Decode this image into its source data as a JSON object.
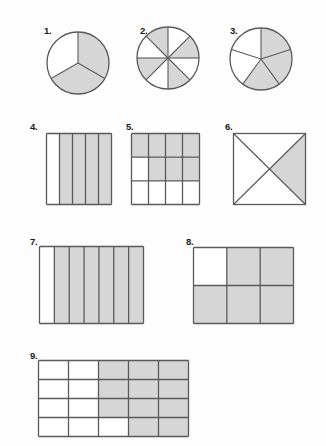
{
  "worksheet": {
    "title": "Fraction Shading Worksheet",
    "background_color": "#fdfdfd",
    "shade_color": "#d6d6d6",
    "stroke_color": "#5a5a5a",
    "unshaded_color": "#ffffff",
    "label_color": "#1a1a1a"
  },
  "figures": [
    {
      "number": "1.",
      "shape": "circle",
      "parts_total": 3,
      "parts_shaded": 2,
      "fraction": "2/3",
      "start_angle_deg": -90,
      "shaded_indices": [
        0,
        1
      ],
      "label_x": 44,
      "label_y": 26,
      "cx": 78,
      "cy": 63,
      "r": 31
    },
    {
      "number": "2.",
      "shape": "circle",
      "parts_total": 8,
      "parts_shaded": 4,
      "fraction": "4/8",
      "start_angle_deg": -90,
      "shaded_indices": [
        1,
        3,
        5,
        7
      ],
      "label_x": 140,
      "label_y": 26,
      "cx": 168,
      "cy": 58,
      "r": 31
    },
    {
      "number": "3.",
      "shape": "circle",
      "parts_total": 5,
      "parts_shaded": 3,
      "fraction": "3/5",
      "start_angle_deg": -90,
      "shaded_indices": [
        0,
        1,
        2
      ],
      "label_x": 230,
      "label_y": 26,
      "cx": 261,
      "cy": 59,
      "r": 31
    },
    {
      "number": "4.",
      "shape": "grid",
      "columns": 5,
      "rows": 1,
      "parts_total": 5,
      "parts_shaded": 4,
      "fraction": "4/5",
      "shaded_cells": [
        [
          0,
          1
        ],
        [
          0,
          2
        ],
        [
          0,
          3
        ],
        [
          0,
          4
        ]
      ],
      "label_x": 30,
      "label_y": 122,
      "x": 46,
      "y": 133,
      "width": 65,
      "height": 71
    },
    {
      "number": "5.",
      "shape": "grid",
      "columns": 4,
      "rows": 3,
      "parts_total": 12,
      "parts_shaded": 7,
      "fraction": "7/12",
      "shaded_cells": [
        [
          0,
          0
        ],
        [
          0,
          1
        ],
        [
          0,
          2
        ],
        [
          0,
          3
        ],
        [
          1,
          1
        ],
        [
          1,
          2
        ],
        [
          1,
          3
        ]
      ],
      "label_x": 126,
      "label_y": 122,
      "x": 131,
      "y": 133,
      "width": 68,
      "height": 71
    },
    {
      "number": "6.",
      "shape": "square-diagonals",
      "parts_total": 4,
      "parts_shaded": 1,
      "fraction": "1/4",
      "shaded_indices": [
        1
      ],
      "label_x": 225,
      "label_y": 122,
      "x": 233,
      "y": 133,
      "width": 72,
      "height": 71
    },
    {
      "number": "7.",
      "shape": "grid",
      "columns": 7,
      "rows": 1,
      "parts_total": 7,
      "parts_shaded": 6,
      "fraction": "6/7",
      "shaded_cells": [
        [
          0,
          1
        ],
        [
          0,
          2
        ],
        [
          0,
          3
        ],
        [
          0,
          4
        ],
        [
          0,
          5
        ],
        [
          0,
          6
        ]
      ],
      "label_x": 30,
      "label_y": 237,
      "x": 39,
      "y": 246,
      "width": 104,
      "height": 77
    },
    {
      "number": "8.",
      "shape": "grid",
      "columns": 3,
      "rows": 2,
      "parts_total": 6,
      "parts_shaded": 5,
      "fraction": "5/6",
      "shaded_cells": [
        [
          0,
          1
        ],
        [
          0,
          2
        ],
        [
          1,
          0
        ],
        [
          1,
          1
        ],
        [
          1,
          2
        ]
      ],
      "label_x": 186,
      "label_y": 237,
      "x": 193,
      "y": 247,
      "width": 100,
      "height": 76
    },
    {
      "number": "9.",
      "shape": "grid",
      "columns": 5,
      "rows": 4,
      "parts_total": 20,
      "parts_shaded": 11,
      "fraction": "11/20",
      "shaded_cells": [
        [
          0,
          2
        ],
        [
          0,
          3
        ],
        [
          0,
          4
        ],
        [
          1,
          2
        ],
        [
          1,
          3
        ],
        [
          1,
          4
        ],
        [
          2,
          2
        ],
        [
          2,
          3
        ],
        [
          2,
          4
        ],
        [
          3,
          3
        ],
        [
          3,
          4
        ]
      ],
      "label_x": 30,
      "label_y": 351,
      "x": 38,
      "y": 360,
      "width": 150,
      "height": 76
    }
  ]
}
